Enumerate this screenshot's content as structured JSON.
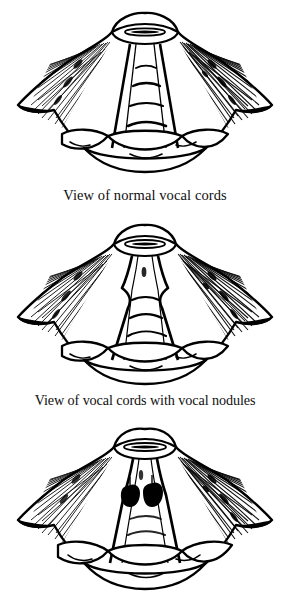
{
  "document": {
    "title": "Views of the vocal cords",
    "background_color": "#ffffff",
    "ink_color": "#000000",
    "style": "black-and-white pen-and-ink line drawing with hatch shading",
    "subject": "laryngoscopic (from above) view of the larynx and vocal cords",
    "panel_count": 3
  },
  "panels": [
    {
      "id": "panel-normal",
      "index": 1,
      "caption": "View of normal vocal cords",
      "has_caption": true,
      "condition": "normal",
      "description": "Larynx seen from above with smooth straight vocal cord edges, open glottis slit at top, radiating hatched walls and tracheal rings visible through the airway.",
      "features": [
        "epiglottis rim at top",
        "narrow elliptical glottic opening",
        "two straight smooth vocal cord folds",
        "tracheal rings below",
        "radiating hatch shading on lateral walls",
        "overlapping rounded lobes at the base"
      ],
      "lesions": []
    },
    {
      "id": "panel-nodules",
      "index": 2,
      "caption": "View of vocal cords with vocal nodules",
      "has_caption": true,
      "condition": "vocal nodules",
      "description": "Same laryngeal view; the vocal cord edges show paired symmetric bulges (nodules) at the junction of the anterior and middle thirds, narrowing the airway.",
      "features": [
        "epiglottis rim at top",
        "glottic opening",
        "paired symmetric swellings on cord margins",
        "tracheal rings below",
        "radiating hatch shading on lateral walls",
        "overlapping rounded lobes at the base"
      ],
      "lesions": [
        {
          "name": "vocal nodule",
          "side": "left cord",
          "shading": "outline bulge"
        },
        {
          "name": "vocal nodule",
          "side": "right cord",
          "shading": "outline bulge"
        }
      ]
    },
    {
      "id": "panel-polyps",
      "index": 3,
      "caption": "",
      "has_caption": false,
      "condition": "vocal cord polyps / dark lesions",
      "description": "Same laryngeal view; two solid dark rounded masses sit on the inner margins of the vocal cords near the upper third.",
      "features": [
        "epiglottis rim at top",
        "glottic opening",
        "two solid black rounded masses on cord margins",
        "tracheal rings below",
        "radiating hatch shading on lateral walls",
        "overlapping rounded lobes at the base"
      ],
      "lesions": [
        {
          "name": "polyp",
          "side": "left cord",
          "shading": "solid black"
        },
        {
          "name": "polyp",
          "side": "right cord",
          "shading": "solid black"
        }
      ]
    }
  ]
}
